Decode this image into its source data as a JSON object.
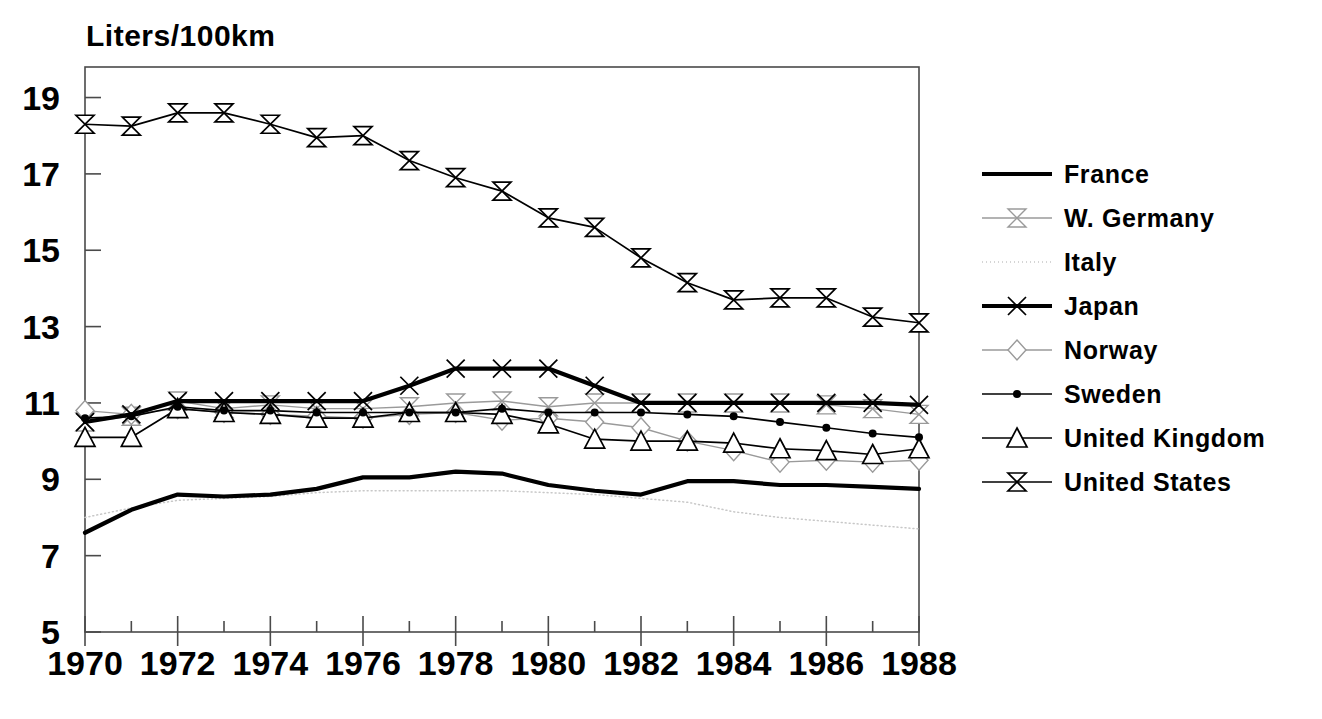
{
  "chart_data": {
    "type": "line",
    "title": "Liters/100km",
    "xlabel": "",
    "ylabel": "Liters/100km",
    "xlim": [
      1970,
      1988
    ],
    "ylim": [
      5,
      19.8
    ],
    "grid": false,
    "legend_position": "right",
    "x": [
      1970,
      1971,
      1972,
      1973,
      1974,
      1975,
      1976,
      1977,
      1978,
      1979,
      1980,
      1981,
      1982,
      1983,
      1984,
      1985,
      1986,
      1987,
      1988
    ],
    "ytick_labels": [
      "5",
      "7",
      "9",
      "11",
      "13",
      "15",
      "17",
      "19"
    ],
    "ytick_values": [
      5,
      7,
      9,
      11,
      13,
      15,
      17,
      19
    ],
    "xtick_labels": [
      "1970",
      "1972",
      "1974",
      "1976",
      "1978",
      "1980",
      "1982",
      "1984",
      "1986",
      "1988"
    ],
    "xtick_values": [
      1970,
      1972,
      1974,
      1976,
      1978,
      1980,
      1982,
      1984,
      1986,
      1988
    ],
    "series": [
      {
        "name": "France",
        "marker": "none",
        "style": "solid-thick",
        "color": "#000000",
        "values": [
          7.6,
          8.2,
          8.6,
          8.55,
          8.6,
          8.75,
          9.05,
          9.05,
          9.2,
          9.15,
          8.85,
          8.7,
          8.6,
          8.95,
          8.95,
          8.85,
          8.85,
          8.8,
          8.75
        ]
      },
      {
        "name": "W. Germany",
        "marker": "bowtie",
        "style": "faint",
        "color": "#9a9a9a",
        "values": [
          10.5,
          10.65,
          11.05,
          10.85,
          10.95,
          10.85,
          10.85,
          10.9,
          11.0,
          11.05,
          10.9,
          11.0,
          11.0,
          11.0,
          11.0,
          11.0,
          10.95,
          10.85,
          10.7
        ]
      },
      {
        "name": "Italy",
        "marker": "none",
        "style": "dotted-faint",
        "color": "#c8c8c8",
        "values": [
          8.0,
          8.25,
          8.45,
          8.5,
          8.55,
          8.65,
          8.7,
          8.7,
          8.7,
          8.7,
          8.65,
          8.6,
          8.5,
          8.4,
          8.15,
          8.0,
          7.9,
          7.8,
          7.7
        ]
      },
      {
        "name": "Japan",
        "marker": "x",
        "style": "solid-thick",
        "color": "#000000",
        "values": [
          10.5,
          10.7,
          11.05,
          11.05,
          11.05,
          11.05,
          11.05,
          11.45,
          11.9,
          11.9,
          11.9,
          11.45,
          11.0,
          11.0,
          11.0,
          11.0,
          11.0,
          11.0,
          10.95
        ]
      },
      {
        "name": "Norway",
        "marker": "diamond",
        "style": "faint",
        "color": "#9a9a9a",
        "values": [
          10.8,
          10.7,
          10.85,
          10.75,
          10.7,
          10.65,
          10.6,
          10.7,
          10.75,
          10.55,
          10.6,
          10.5,
          10.35,
          10.0,
          9.75,
          9.45,
          9.5,
          9.45,
          9.5
        ]
      },
      {
        "name": "Sweden",
        "marker": "dot",
        "style": "solid",
        "color": "#000000",
        "values": [
          10.6,
          10.65,
          10.9,
          10.8,
          10.8,
          10.75,
          10.75,
          10.75,
          10.75,
          10.85,
          10.75,
          10.75,
          10.75,
          10.7,
          10.65,
          10.5,
          10.35,
          10.2,
          10.1
        ]
      },
      {
        "name": "United Kingdom",
        "marker": "triangle",
        "style": "solid",
        "color": "#000000",
        "values": [
          10.1,
          10.1,
          10.85,
          10.75,
          10.7,
          10.6,
          10.6,
          10.75,
          10.75,
          10.7,
          10.45,
          10.05,
          10.0,
          10.0,
          9.95,
          9.8,
          9.75,
          9.65,
          9.8
        ]
      },
      {
        "name": "United States",
        "marker": "bowtie",
        "style": "solid",
        "color": "#000000",
        "values": [
          18.3,
          18.25,
          18.6,
          18.6,
          18.3,
          17.95,
          18.0,
          17.35,
          16.9,
          16.55,
          15.85,
          15.6,
          14.8,
          14.15,
          13.7,
          13.75,
          13.75,
          13.25,
          13.1
        ]
      }
    ]
  }
}
